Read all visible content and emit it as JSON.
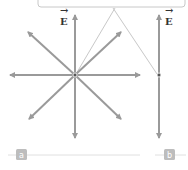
{
  "figure": {
    "panel_a": {
      "label": "a",
      "field_label": "E",
      "description": "Radial electric field lines emanating from a point charge"
    },
    "panel_b": {
      "label": "b",
      "field_label": "E",
      "description": "Electric field along a single line through a point"
    },
    "colors": {
      "arrow": "#9a9a9a",
      "callout_line": "#c8c8c8",
      "badge": "#bdbdbd",
      "baseline": "#e0e0e0",
      "dot": "#555555"
    }
  }
}
